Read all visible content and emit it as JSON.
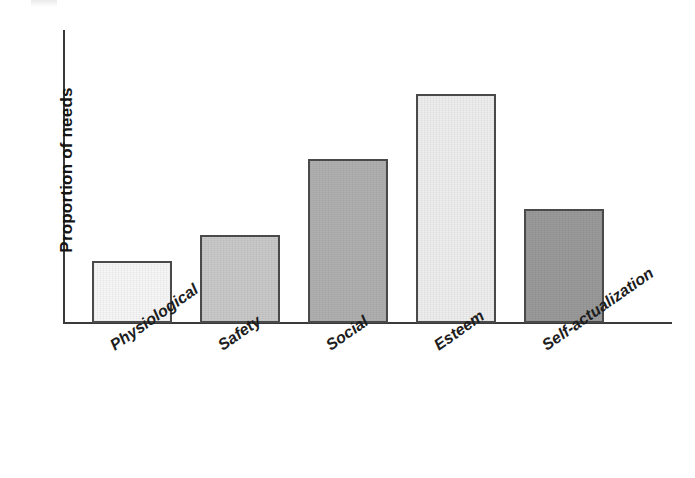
{
  "figure": {
    "background_color": "#ffffff",
    "axis_color": "#3a3a3a",
    "bar_outline_color": "#4a4a4a"
  },
  "axes": {
    "y_title": "Proportion of needs",
    "x_title": ""
  },
  "chart_data": {
    "type": "bar",
    "title": "",
    "subtitle": "",
    "xlabel": "",
    "ylabel": "Proportion of needs",
    "categories": [
      "Physiological",
      "Safety",
      "Social",
      "Esteem",
      "Self-actualization"
    ],
    "values": [
      21,
      30,
      56,
      78,
      39
    ],
    "ylim": [
      0,
      100
    ],
    "grid": false,
    "legend": false,
    "legend_position": "none",
    "y_tick_labels": [],
    "x_tick_label_rotation_deg": -35,
    "annotations": [],
    "bar_fill_colors": [
      "#f7f7f7",
      "#c9c9c9",
      "#b0b0b0",
      "#eeeeee",
      "#9a9a9a"
    ],
    "series": [
      {
        "name": "Proportion of needs",
        "values": [
          21,
          30,
          56,
          78,
          39
        ]
      }
    ]
  }
}
